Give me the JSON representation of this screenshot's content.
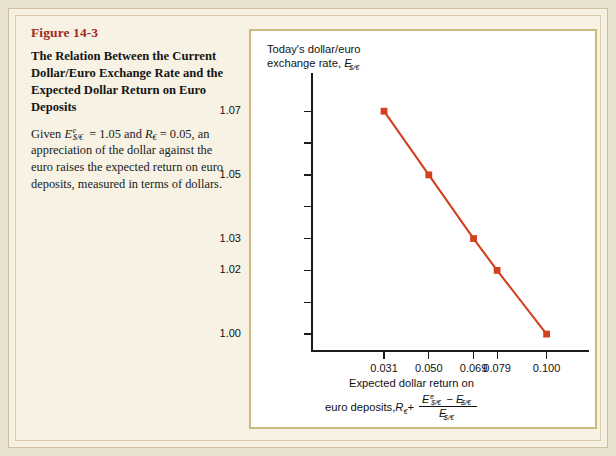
{
  "figure": {
    "number": "Figure 14-3",
    "title": "The Relation Between the Current Dollar/Euro Exchange Rate and the Expected Dollar Return on Euro Deposits",
    "description_parts": {
      "p1": "Given ",
      "p2": " = 1.05 and ",
      "p3": " = 0.05, an appreciation of the dollar against the euro raises the expected return on euro deposits, measured in terms of dollars.",
      "e_symbol": "E",
      "e_sup": "e",
      "e_sub": "$/€",
      "r_symbol": "R",
      "r_sub": "€"
    }
  },
  "chart_data": {
    "type": "line",
    "title": "",
    "ylabel_line1": "Today's dollar/euro",
    "ylabel_line2": "exchange rate, ",
    "ylabel_symbol": "E",
    "ylabel_sub": "$/€",
    "xlabel_line1": "Expected dollar return on",
    "xlabel_line2": "euro deposits, ",
    "xlabel_r": "R",
    "xlabel_r_sub": "€",
    "xlabel_plus": " +",
    "xlabel_frac_num_e1": "E",
    "xlabel_frac_num_e1_sup": "e",
    "xlabel_frac_num_e1_sub": "$/€",
    "xlabel_frac_minus": " − ",
    "xlabel_frac_num_e2": "E",
    "xlabel_frac_num_e2_sub": "$/€",
    "xlabel_frac_den_e": "E",
    "xlabel_frac_den_sub": "$/€",
    "x": [
      0.031,
      0.05,
      0.069,
      0.079,
      0.1
    ],
    "y": [
      1.07,
      1.05,
      1.03,
      1.02,
      1.0
    ],
    "xtick_labels": [
      "0.031",
      "0.050",
      "0.069",
      "0.079",
      "0.100"
    ],
    "ytick_labels": [
      "1.07",
      "",
      "1.05",
      "",
      "1.03",
      "1.02",
      "",
      "1.00"
    ],
    "ytick_values": [
      1.07,
      1.06,
      1.05,
      1.04,
      1.03,
      1.02,
      1.01,
      1.0
    ],
    "ylim": [
      0.995,
      1.082
    ],
    "xlim": [
      0.0,
      0.118
    ],
    "grid": false,
    "legend": "none",
    "series_color": "#d2401e",
    "marker": "square"
  },
  "colors": {
    "page_background": "#e9e2d0",
    "panel_background": "#f7f2e4",
    "chart_background": "#ffffff",
    "chart_border": "#cdb87f",
    "figure_number": "#9e2b20",
    "accent_line": "#d2401e",
    "axis": "#1c1c1c"
  }
}
